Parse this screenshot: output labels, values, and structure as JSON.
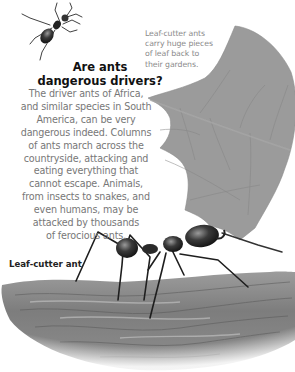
{
  "heading": {
    "line1": "Are ants",
    "line2": "dangerous drivers?"
  },
  "body": {
    "lines": [
      "The driver ants of Africa,",
      "and similar species in South",
      "America, can be very",
      "dangerous indeed. Columns",
      "of ants march across the",
      "countryside, attacking and",
      "eating everything that",
      "cannot escape. Animals,",
      "from insects to snakes, and",
      "even humans, may be",
      "attacked by thousands",
      "of ferocious ants."
    ]
  },
  "caption": {
    "lines": [
      "Leaf-cutter ants",
      "carry huge pieces",
      "of leaf back to",
      "their gardens."
    ]
  },
  "illustration_label": "Leaf-cutter ant",
  "colors": {
    "heading": "#111111",
    "body_text": "#777777",
    "caption": "#8a8a8a",
    "leaf": "#9a9a9a",
    "branch": "#7a7a7a"
  },
  "illustrations": [
    "driver-ant-small",
    "leaf-fragment",
    "leaf-cutter-ant",
    "branch"
  ]
}
